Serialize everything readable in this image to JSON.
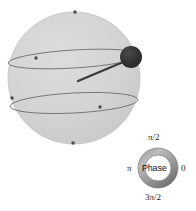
{
  "figure": {
    "name": "bloch-sphere-with-phase-dial",
    "background_color": "#ffffff",
    "sphere": {
      "name": "bloch-sphere",
      "center_x": 74,
      "center_y": 78,
      "radius": 66,
      "fill_color": "#d4d4d4",
      "edge_color": "#c2c2c2"
    },
    "latitude_circles": [
      {
        "name": "upper-latitude-circle",
        "center_x": 74,
        "center_y": 59,
        "rx": 66,
        "ry": 9,
        "rotation_deg": -3.5,
        "color": "#6e6e6e"
      },
      {
        "name": "lower-latitude-circle",
        "center_x": 74,
        "center_y": 103,
        "rx": 64,
        "ry": 10,
        "rotation_deg": -3.0,
        "color": "#6e6e6e"
      }
    ],
    "state_vector": {
      "name": "state-vector",
      "x1": 78,
      "y1": 81,
      "x2": 128,
      "y2": 60,
      "color": "#3c3c3c",
      "width": 2.4
    },
    "state_ball": {
      "name": "state-ball",
      "cx": 131,
      "cy": 57,
      "r": 11,
      "fill_color": "#2f2f2f"
    },
    "marker_dots": [
      {
        "name": "pole-dot-top",
        "cx": 75,
        "cy": 12,
        "r": 1.6
      },
      {
        "name": "pole-dot-bottom",
        "cx": 73,
        "cy": 143,
        "r": 1.6
      },
      {
        "name": "upper-circle-dot",
        "cx": 36,
        "cy": 58,
        "r": 1.6
      },
      {
        "name": "lower-circle-dot-left",
        "cx": 12,
        "cy": 98,
        "r": 1.6
      },
      {
        "name": "lower-circle-dot-right",
        "cx": 100,
        "cy": 107,
        "r": 1.6
      }
    ],
    "marker_dot_color": "#4a4a4a"
  },
  "phase_dial": {
    "name": "phase-dial",
    "center_x": 158,
    "center_y": 168,
    "outer_radius": 20,
    "inner_radius": 13,
    "ring_color_light": "#b9b9b9",
    "ring_color_dark": "#6b6b6b",
    "center_label": "Phase",
    "labels": {
      "top": "π/2",
      "left": "π",
      "right": "0",
      "bottom": "3π/2"
    }
  }
}
